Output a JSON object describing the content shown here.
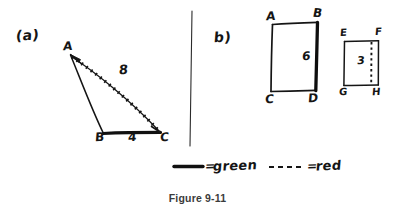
{
  "figure": {
    "caption": "Figure 9-11",
    "divider": "vertical-rule"
  },
  "part_a": {
    "label": "(a)",
    "shape": "triangle",
    "vertices": [
      {
        "name": "A",
        "x": 70,
        "y": 54
      },
      {
        "name": "B",
        "x": 103,
        "y": 134
      },
      {
        "name": "C",
        "x": 160,
        "y": 134
      }
    ],
    "edges": [
      {
        "name": "AC",
        "measure": "8",
        "style": "dashed",
        "color_name": "red",
        "arrow": "at-A"
      },
      {
        "name": "BC",
        "measure": "4",
        "style": "solid",
        "color_name": "green",
        "arrow": "none"
      },
      {
        "name": "AB",
        "measure": "",
        "style": "thin",
        "color_name": "black",
        "arrow": "none"
      }
    ],
    "measure_labels": [
      {
        "text": "8",
        "x": 122,
        "y": 74
      },
      {
        "text": "4",
        "x": 128,
        "y": 138
      }
    ],
    "vertex_labels": [
      {
        "text": "A",
        "x": 63,
        "y": 40
      },
      {
        "text": "B",
        "x": 96,
        "y": 138
      },
      {
        "text": "C",
        "x": 160,
        "y": 138
      }
    ]
  },
  "part_b": {
    "label": "b)",
    "shapes": [
      {
        "name": "rectangle-ABCD",
        "corners": [
          "A",
          "B",
          "C",
          "D"
        ],
        "highlight_edge": "BD",
        "highlight_style": "solid",
        "highlight_color_name": "green",
        "measure": "6",
        "corner_labels": [
          {
            "text": "A",
            "x": 268,
            "y": 16
          },
          {
            "text": "B",
            "x": 312,
            "y": 13
          },
          {
            "text": "C",
            "x": 268,
            "y": 98
          },
          {
            "text": "D",
            "x": 310,
            "y": 97
          }
        ],
        "measure_label": {
          "text": "6",
          "x": 303,
          "y": 57
        }
      },
      {
        "name": "rectangle-EFGH",
        "corners": [
          "E",
          "F",
          "G",
          "H"
        ],
        "highlight_edge": "interior-vertical",
        "highlight_style": "dashed",
        "highlight_color_name": "red",
        "measure": "3",
        "corner_labels": [
          {
            "text": "E",
            "x": 341,
            "y": 34
          },
          {
            "text": "F",
            "x": 375,
            "y": 32
          },
          {
            "text": "G",
            "x": 340,
            "y": 92
          },
          {
            "text": "H",
            "x": 373,
            "y": 92
          }
        ],
        "measure_label": {
          "text": "3",
          "x": 358,
          "y": 61
        }
      }
    ]
  },
  "legend": {
    "items": [
      {
        "swatch": "solid-line",
        "equals": "=",
        "label": "green"
      },
      {
        "swatch": "dashed-line",
        "equals": "=",
        "label": "red"
      }
    ]
  }
}
